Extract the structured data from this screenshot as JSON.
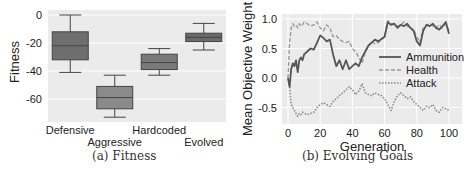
{
  "chart_data": [
    {
      "type": "box",
      "title": "",
      "caption": "(a) Fitness",
      "xlabel": "",
      "ylabel": "Fitness",
      "ylim": [
        -76,
        3
      ],
      "yticks": [
        0,
        -20,
        -40,
        -60
      ],
      "ytick_labels": [
        "0",
        "-20",
        "-40",
        "-60"
      ],
      "grid": true,
      "categories": [
        "Defensive",
        "Aggressive",
        "Hardcoded",
        "Evolved"
      ],
      "boxes": [
        {
          "name": "Defensive",
          "whisker_low": -41,
          "q1": -32,
          "median": -22,
          "q3": -12,
          "whisker_high": 0,
          "color": "#6e6e6e"
        },
        {
          "name": "Aggressive",
          "whisker_low": -73,
          "q1": -67,
          "median": -59,
          "q3": -51,
          "whisker_high": -43,
          "color": "#8a8a8a"
        },
        {
          "name": "Hardcoded",
          "whisker_low": -43,
          "q1": -39,
          "median": -34,
          "q3": -28,
          "whisker_high": -24,
          "color": "#7a7a7a"
        },
        {
          "name": "Evolved",
          "whisker_low": -25,
          "q1": -19,
          "median": -16,
          "q3": -13,
          "whisker_high": -6,
          "color": "#6a6a6a"
        }
      ]
    },
    {
      "type": "line",
      "title": "",
      "caption": "(b) Evolving Goals",
      "xlabel": "Generation",
      "ylabel": "Mean Objective Weight",
      "xlim": [
        -2,
        102
      ],
      "ylim": [
        -0.75,
        1.08
      ],
      "xticks": [
        0,
        20,
        40,
        60,
        80,
        100
      ],
      "xtick_labels": [
        "0",
        "20",
        "40",
        "60",
        "80",
        "100"
      ],
      "yticks": [
        1.0,
        0.5,
        0.0,
        -0.5
      ],
      "ytick_labels": [
        "1.0",
        "0.5",
        "0.0",
        "-0.5"
      ],
      "grid": true,
      "legend_position": "center right",
      "x": [
        0,
        1,
        2,
        3,
        4,
        5,
        6,
        7,
        8,
        9,
        10,
        12,
        14,
        16,
        18,
        20,
        22,
        24,
        26,
        28,
        30,
        32,
        34,
        36,
        38,
        40,
        42,
        44,
        46,
        48,
        50,
        52,
        54,
        56,
        58,
        60,
        62,
        64,
        66,
        68,
        70,
        72,
        74,
        76,
        78,
        80,
        82,
        84,
        86,
        88,
        90,
        92,
        94,
        96,
        98,
        100
      ],
      "series": [
        {
          "name": "Ammunition",
          "style": "solid",
          "color": "#555555",
          "values": [
            0.0,
            -0.15,
            0.15,
            0.25,
            0.2,
            0.3,
            0.1,
            0.3,
            0.35,
            0.3,
            0.4,
            0.45,
            0.5,
            0.48,
            0.6,
            0.72,
            0.68,
            0.62,
            0.65,
            0.4,
            0.2,
            0.3,
            0.15,
            0.3,
            0.15,
            0.2,
            0.25,
            0.2,
            0.35,
            0.45,
            0.55,
            0.6,
            0.65,
            0.62,
            0.66,
            0.7,
            0.95,
            0.9,
            0.92,
            0.85,
            0.9,
            0.88,
            0.92,
            0.85,
            0.8,
            0.62,
            0.55,
            0.8,
            0.9,
            0.88,
            0.92,
            0.85,
            0.82,
            0.88,
            0.95,
            0.75
          ]
        },
        {
          "name": "Health",
          "style": "dashed",
          "color": "#9a9a9a",
          "values": [
            0.0,
            0.6,
            0.85,
            0.92,
            0.88,
            0.9,
            0.85,
            0.92,
            0.88,
            0.9,
            0.95,
            0.92,
            0.88,
            0.9,
            0.95,
            0.85,
            0.8,
            0.9,
            0.85,
            0.7,
            0.72,
            0.65,
            0.62,
            0.6,
            0.62,
            0.5,
            0.45,
            0.35,
            0.25,
            0.45,
            0.55,
            0.62,
            0.58,
            0.6,
            0.65,
            0.7,
            0.97,
            0.92,
            0.9,
            0.88,
            0.9,
            0.95,
            0.88,
            0.85,
            0.82,
            0.7,
            0.6,
            0.85,
            0.9,
            0.92,
            0.88,
            0.85,
            0.9,
            0.85,
            0.92,
            0.8
          ]
        },
        {
          "name": "Attack",
          "style": "dotted",
          "color": "#8c8c8c",
          "values": [
            0.0,
            -0.15,
            -0.45,
            -0.5,
            -0.55,
            -0.6,
            -0.65,
            -0.6,
            -0.62,
            -0.58,
            -0.6,
            -0.62,
            -0.6,
            -0.58,
            -0.5,
            -0.45,
            -0.42,
            -0.45,
            -0.48,
            -0.4,
            -0.35,
            -0.3,
            -0.25,
            -0.2,
            -0.15,
            -0.2,
            -0.28,
            -0.22,
            -0.1,
            -0.25,
            -0.28,
            -0.3,
            -0.25,
            -0.28,
            -0.3,
            -0.35,
            -0.45,
            -0.55,
            -0.4,
            -0.3,
            -0.25,
            -0.3,
            -0.35,
            -0.32,
            -0.4,
            -0.45,
            -0.5,
            -0.55,
            -0.48,
            -0.5,
            -0.45,
            -0.55,
            -0.58,
            -0.5,
            -0.52,
            -0.55
          ]
        }
      ]
    }
  ],
  "panels": {
    "a": {
      "caption": "(a) Fitness",
      "ylabel": "Fitness",
      "yticks": [
        "0",
        "-20",
        "-40",
        "-60"
      ],
      "categories": [
        "Defensive",
        "Aggressive",
        "Hardcoded",
        "Evolved"
      ]
    },
    "b": {
      "caption": "(b) Evolving Goals",
      "ylabel": "Mean Objective Weight",
      "xlabel": "Generation",
      "yticks": [
        "1.0",
        "0.5",
        "0.0",
        "-0.5"
      ],
      "xticks": [
        "0",
        "20",
        "40",
        "60",
        "80",
        "100"
      ],
      "legend": [
        "Ammunition",
        "Health",
        "Attack"
      ]
    }
  },
  "colors": {
    "plot_bg": "#ebebeb",
    "grid": "#ffffff",
    "box_edge": "#444444",
    "text": "#222222"
  }
}
